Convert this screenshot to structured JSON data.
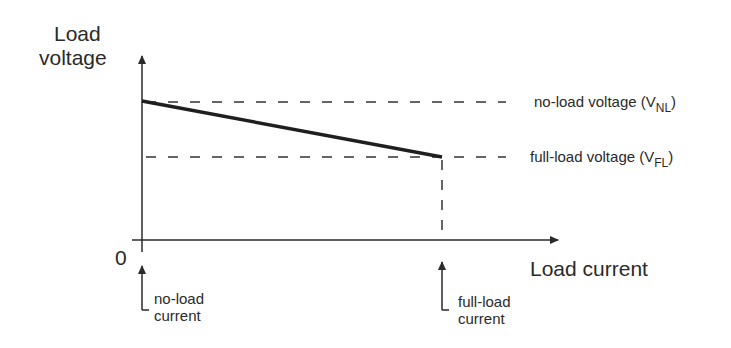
{
  "diagram": {
    "type": "load voltage vs load current regulation graph",
    "y_axis": {
      "title_line1": "Load",
      "title_line2": "voltage"
    },
    "x_axis": {
      "title": "Load current",
      "origin_label": "0"
    },
    "levels": [
      {
        "name": "no-load voltage",
        "text": "no-load voltage (V",
        "subscript": "NL",
        "close": ")"
      },
      {
        "name": "full-load voltage",
        "text": "full-load voltage (V",
        "subscript": "FL",
        "close": ")"
      }
    ],
    "current_markers": [
      {
        "line1": "no-load",
        "line2": "current"
      },
      {
        "line1": "full-load",
        "line2": "current"
      }
    ],
    "colors": {
      "ink": "#2a2a2a",
      "background": "#ffffff"
    }
  }
}
